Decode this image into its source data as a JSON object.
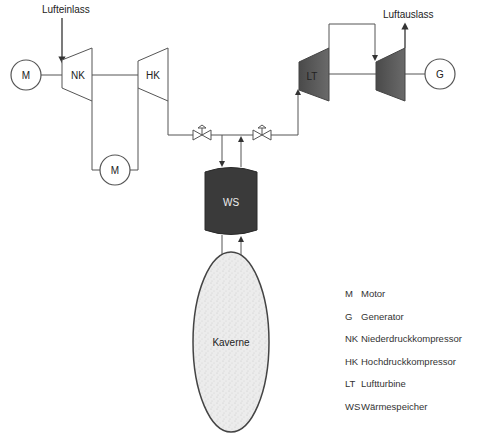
{
  "diagram": {
    "labels": {
      "air_inlet": "Lufteinlass",
      "air_outlet": "Luftauslass",
      "motor_left": "M",
      "motor_bottom": "M",
      "nk": "NK",
      "hk": "HK",
      "lt": "LT",
      "generator": "G",
      "ws": "WS",
      "cavern": "Kaverne"
    },
    "colors": {
      "line": "#555555",
      "turbine_fill": "#555555",
      "vessel_fill": "#3a3a3a",
      "cavern_fill": "#e6e6e6",
      "cavern_stroke": "#444444"
    }
  },
  "legend": {
    "items": [
      {
        "abbr": "M",
        "label": "Motor"
      },
      {
        "abbr": "G",
        "label": "Generator"
      },
      {
        "abbr": "NK",
        "label": "Niederdruckkompressor"
      },
      {
        "abbr": "HK",
        "label": "Hochdruckkompressor"
      },
      {
        "abbr": "LT",
        "label": "Luftturbine"
      },
      {
        "abbr": "WS",
        "label": "Wärmespeicher"
      }
    ]
  }
}
